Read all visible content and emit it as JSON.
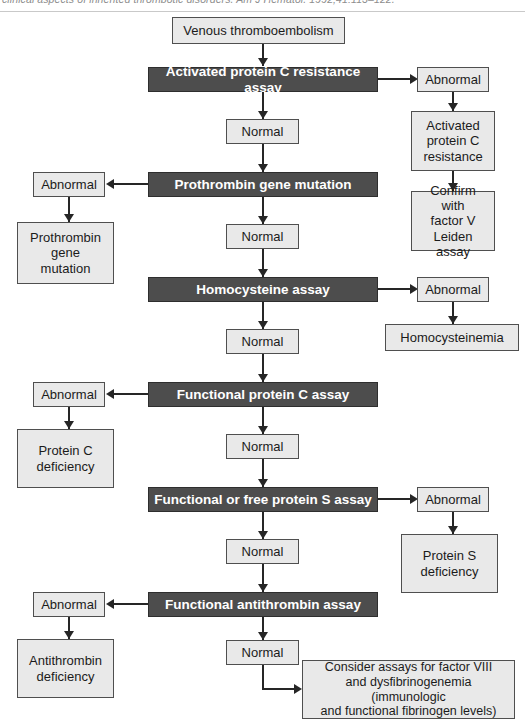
{
  "page": {
    "citation": "clinical aspects of inherited thrombotic disorders. Am J Hematol. 1992;41:113–122."
  },
  "colors": {
    "dark_box_fill": "#4d4d4d",
    "dark_box_text": "#ffffff",
    "light_box_fill": "#e9e9e9",
    "light_box_text": "#1b1b1b",
    "border": "#4f4f4f",
    "connector": "#262626",
    "page_background": "#ffffff"
  },
  "flowchart": {
    "type": "flowchart",
    "start": {
      "id": "start",
      "label": "Venous thromboembolism",
      "style": "light"
    },
    "spine": [
      {
        "id": "apc-assay",
        "label": "Activated protein C resistance assay",
        "style": "dark",
        "branch": "right"
      },
      {
        "id": "normal-1",
        "label": "Normal",
        "style": "light"
      },
      {
        "id": "prothrombin-assay",
        "label": "Prothrombin gene mutation",
        "style": "dark",
        "branch": "left"
      },
      {
        "id": "normal-2",
        "label": "Normal",
        "style": "light"
      },
      {
        "id": "homocysteine-assay",
        "label": "Homocysteine assay",
        "style": "dark",
        "branch": "right"
      },
      {
        "id": "normal-3",
        "label": "Normal",
        "style": "light"
      },
      {
        "id": "protein-c-assay",
        "label": "Functional protein C assay",
        "style": "dark",
        "branch": "left"
      },
      {
        "id": "normal-4",
        "label": "Normal",
        "style": "light"
      },
      {
        "id": "protein-s-assay",
        "label": "Functional or free protein S assay",
        "style": "dark",
        "branch": "right"
      },
      {
        "id": "normal-5",
        "label": "Normal",
        "style": "light"
      },
      {
        "id": "antithrombin-assay",
        "label": "Functional antithrombin assay",
        "style": "dark",
        "branch": "left"
      },
      {
        "id": "normal-6",
        "label": "Normal",
        "style": "light"
      }
    ],
    "branches": [
      {
        "id": "branch-apc",
        "side": "right",
        "from": "apc-assay",
        "abnormal_label": "Abnormal",
        "results": [
          "Activated\nprotein C\nresistance",
          "Confirm with\nfactor V\nLeiden assay"
        ]
      },
      {
        "id": "branch-prothrombin",
        "side": "left",
        "from": "prothrombin-assay",
        "abnormal_label": "Abnormal",
        "results": [
          "Prothrombin\ngene\nmutation"
        ]
      },
      {
        "id": "branch-homocysteine",
        "side": "right",
        "from": "homocysteine-assay",
        "abnormal_label": "Abnormal",
        "results": [
          "Homocysteinemia"
        ]
      },
      {
        "id": "branch-protein-c",
        "side": "left",
        "from": "protein-c-assay",
        "abnormal_label": "Abnormal",
        "results": [
          "Protein C\ndeficiency"
        ]
      },
      {
        "id": "branch-protein-s",
        "side": "right",
        "from": "protein-s-assay",
        "abnormal_label": "Abnormal",
        "results": [
          "Protein S\ndeficiency"
        ]
      },
      {
        "id": "branch-antithrombin",
        "side": "left",
        "from": "antithrombin-assay",
        "abnormal_label": "Abnormal",
        "results": [
          "Antithrombin\ndeficiency"
        ]
      }
    ],
    "terminal": {
      "id": "consider-assays",
      "label": "Consider assays for factor VIII\nand dysfibrinogenemia (immunologic\nand functional fibrinogen levels)",
      "style": "light"
    }
  }
}
